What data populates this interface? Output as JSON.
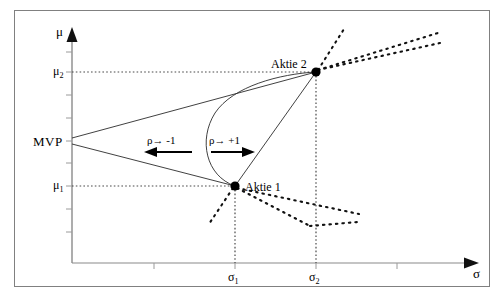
{
  "figure": {
    "type": "diagram"
  },
  "axes": {
    "y_axis": {
      "label": "μ",
      "name": "mu-axis",
      "x": 72,
      "top": 30,
      "bottom": 263
    },
    "x_axis": {
      "label": "σ",
      "name": "sigma-axis",
      "y": 263,
      "left": 72,
      "right": 478
    }
  },
  "ticks": {
    "y": [
      {
        "label": "μ",
        "sub": "2",
        "y": 72
      },
      {
        "label": "μ",
        "sub": "1",
        "y": 186
      }
    ],
    "x": [
      {
        "label": "σ",
        "sub": "1",
        "x": 235
      },
      {
        "label": "σ",
        "sub": "2",
        "x": 316
      }
    ]
  },
  "points": [
    {
      "name": "asset-1",
      "label": "Aktie 1",
      "x": 235,
      "y": 186
    },
    {
      "name": "asset-2",
      "label": "Aktie 2",
      "x": 316,
      "y": 72
    }
  ],
  "annotations": {
    "mvp": {
      "label": "MVP",
      "x": 34,
      "y": 134
    },
    "rho_minus": {
      "label": "ρ→ -1",
      "direction": "left",
      "x": 148,
      "y": 133
    },
    "rho_plus": {
      "label": "ρ→ +1",
      "direction": "right",
      "x": 208,
      "y": 133
    }
  },
  "colors": {
    "frame": "#808080",
    "axis": "#808080",
    "curve": "#000000",
    "dotted": "#000000",
    "point": "#000000",
    "background": "#ffffff"
  }
}
